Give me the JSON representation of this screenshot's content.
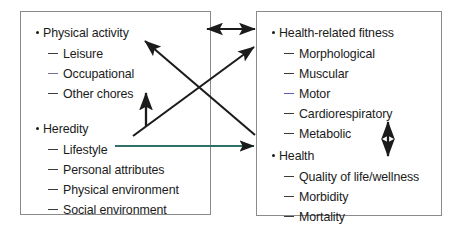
{
  "diagram": {
    "panels": [
      {
        "id": "left",
        "groups": [
          {
            "heading": "Physical activity",
            "items": [
              {
                "label": "Leisure",
                "dash_color": "#3b3b3b"
              },
              {
                "label": "Occupational",
                "dash_color": "#7a6c93"
              },
              {
                "label": "Other chores",
                "dash_color": "#3b3b3b"
              }
            ]
          },
          {
            "heading": "Heredity",
            "items": [
              {
                "label": "Lifestyle",
                "dash_color": "#3b3b3b"
              },
              {
                "label": "Personal attributes",
                "dash_color": "#3b3b3b"
              },
              {
                "label": "Physical environment",
                "dash_color": "#3b3b3b"
              },
              {
                "label": "Social environment",
                "dash_color": "#3b3b3b"
              }
            ]
          }
        ]
      },
      {
        "id": "right",
        "groups": [
          {
            "heading": "Health-related fitness",
            "items": [
              {
                "label": "Morphological",
                "dash_color": "#3b3b3b"
              },
              {
                "label": "Muscular",
                "dash_color": "#3b3b3b"
              },
              {
                "label": "Motor",
                "dash_color": "#5b5fae"
              },
              {
                "label": "Cardiorespiratory",
                "dash_color": "#3b3b3b"
              },
              {
                "label": "Metabolic",
                "dash_color": "#3b3b3b"
              }
            ]
          },
          {
            "heading": "Health",
            "items": [
              {
                "label": "Quality of life/wellness",
                "dash_color": "#3b3b3b"
              },
              {
                "label": "Morbidity",
                "dash_color": "#3b3b3b"
              },
              {
                "label": "Mortality",
                "dash_color": "#3b3b3b"
              }
            ]
          }
        ]
      }
    ],
    "connectors": [
      {
        "name": "physical-activity-to-fitness",
        "style": "double-headed",
        "orientation": "horizontal",
        "color": "#1b1b1b"
      },
      {
        "name": "lifestyle-to-fitness",
        "style": "single-headed",
        "orientation": "diagonal-up",
        "color": "#1b1b1b"
      },
      {
        "name": "fitness-to-physical-activity",
        "style": "single-headed",
        "orientation": "diagonal-up-left",
        "color": "#1b1b1b"
      },
      {
        "name": "physical-activity-to-health",
        "style": "single-headed",
        "orientation": "diagonal-down",
        "color": "#1b1b1b"
      },
      {
        "name": "heredity-to-physical-activity",
        "style": "single-headed",
        "orientation": "vertical-up",
        "color": "#1b1b1b"
      },
      {
        "name": "lifestyle-to-health",
        "style": "single-headed",
        "orientation": "horizontal",
        "color": "#2f6f68"
      },
      {
        "name": "fitness-health-interaction",
        "style": "double-headed",
        "orientation": "vertical",
        "color": "#1b1b1b"
      }
    ],
    "colors": {
      "panel_border": "#8a8a8a",
      "text": "#1b1b1b",
      "arrow_dark": "#1b1b1b",
      "arrow_teal": "#2f6f68",
      "dash_purple": "#7a6c93",
      "dash_blue": "#5b5fae",
      "background": "#ffffff"
    }
  }
}
